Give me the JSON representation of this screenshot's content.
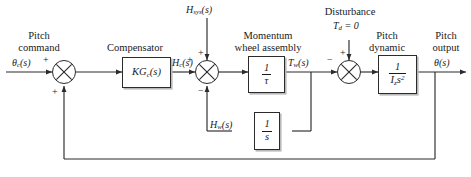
{
  "diagram": {
    "input": {
      "caption_line1": "Pitch",
      "caption_line2": "command",
      "signal": "θc(s)"
    },
    "output": {
      "caption_line1": "Pitch",
      "caption_line2": "output",
      "signal": "θ(s)"
    },
    "groups": {
      "compensator": "Compensator",
      "momentum_wheel_line1": "Momentum",
      "momentum_wheel_line2": "wheel assembly",
      "pitch_dynamic_line1": "Pitch",
      "pitch_dynamic_line2": "dynamic",
      "disturbance_label": "Disturbance",
      "disturbance_value": "Td = 0"
    },
    "blocks": [
      {
        "name": "compensator",
        "text": "KGc(s)",
        "numerator": "",
        "denominator": ""
      },
      {
        "name": "momentum-wheel",
        "text": "",
        "numerator": "1",
        "denominator": "τ"
      },
      {
        "name": "integrator",
        "text": "",
        "numerator": "1",
        "denominator": "s"
      },
      {
        "name": "pitch-dynamic",
        "text": "",
        "numerator": "1",
        "denominator": "Izs²"
      }
    ],
    "signals": {
      "hsys": "Hsys(s)",
      "hc": "Hc(s)",
      "hw": "Hw(s)",
      "tw": "Tw(s)"
    },
    "signs": {
      "sum1_left": "+",
      "sum1_bottom": "+",
      "sum2_left": "+",
      "sum2_top": "+",
      "sum2_bottom": "−",
      "sum3_left": "−",
      "sum3_top": "+"
    },
    "colors": {
      "line": "#2b2b2b",
      "shadow": "#b9b9b9",
      "background": "#ffffff",
      "text": "#1a1a1a"
    }
  }
}
